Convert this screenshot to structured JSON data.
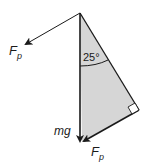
{
  "diagram": {
    "type": "force-vector-triangle",
    "labels": {
      "fp_top_main": "F",
      "fp_top_sub": "p",
      "angle": "25°",
      "mg": "mg",
      "fp_bottom_main": "F",
      "fp_bottom_sub": "p"
    },
    "colors": {
      "fill": "#d6d6d6",
      "stroke": "#1a1a1a",
      "background": "#ffffff"
    },
    "geometry": {
      "apex": [
        80,
        13
      ],
      "mg_tip": [
        80,
        143
      ],
      "right_angle_vertex": [
        139,
        110
      ],
      "fp_top_tip": [
        24,
        45
      ],
      "angle_deg": 25
    }
  }
}
